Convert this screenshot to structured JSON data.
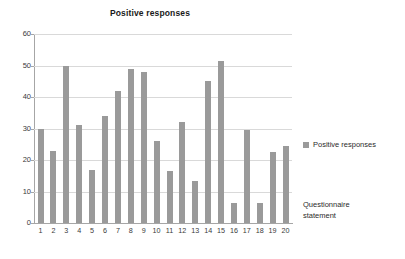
{
  "chart_data": {
    "type": "bar",
    "title": "Positive responses",
    "xlabel": "Questionnaire statement",
    "ylabel": "",
    "categories": [
      "1",
      "2",
      "3",
      "4",
      "5",
      "6",
      "7",
      "8",
      "9",
      "10",
      "11",
      "12",
      "13",
      "14",
      "15",
      "16",
      "17",
      "18",
      "19",
      "20"
    ],
    "values": [
      30,
      23,
      50,
      31,
      17,
      34,
      42,
      49,
      48,
      26,
      16.5,
      32,
      13.5,
      45,
      51.5,
      6.5,
      29.5,
      6.5,
      22.5,
      24.5
    ],
    "series": [
      {
        "name": "Positive responses",
        "values": [
          30,
          23,
          50,
          31,
          17,
          34,
          42,
          49,
          48,
          26,
          16.5,
          32,
          13.5,
          45,
          51.5,
          6.5,
          29.5,
          6.5,
          22.5,
          24.5
        ]
      }
    ],
    "ylim": [
      0,
      60
    ],
    "yticks": [
      0,
      10,
      20,
      30,
      40,
      50,
      60
    ],
    "ytick_labels": [
      "0",
      "10",
      "20",
      "30",
      "40",
      "50",
      "60"
    ],
    "grid": true,
    "grid_axis": "y",
    "legend": {
      "position": "right",
      "entries": [
        {
          "label": "Positive responses",
          "color": "#9a9a9a",
          "marker": "square"
        }
      ]
    },
    "colors": {
      "bar": "#9a9a9a",
      "gridline": "#d9d9d9",
      "axis": "#a6a6a6",
      "text": "#2b2b2b",
      "background": "#ffffff"
    }
  },
  "axis_caption": {
    "line1": "Questionnaire",
    "line2": "statement"
  }
}
